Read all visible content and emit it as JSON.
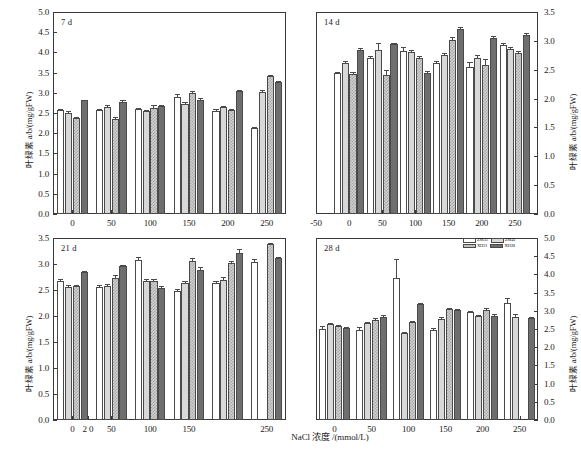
{
  "figure": {
    "xlabel": "NaCl 浓度 /(mmol/L)",
    "ylabel": "叶绿素 a/b/(mg/gFW)",
    "legend": [
      {
        "key": "ZM35",
        "label": "ZM35",
        "style": "open-white"
      },
      {
        "key": "ZM41",
        "label": "ZM41",
        "style": "light-gray"
      },
      {
        "key": "XH21",
        "label": "XH21",
        "style": "checkered"
      },
      {
        "key": "XH28",
        "label": "XH28",
        "style": "dark-gray"
      }
    ],
    "colors": {
      "ZM35": "#ffffff",
      "ZM41": "#d8d8d8",
      "XH21": "#cfcfcf",
      "XH28": "#6e6e6e",
      "axis": "#3a3a3a"
    }
  },
  "chart_data": [
    {
      "type": "bar",
      "title": "7 d",
      "panel": "top-left",
      "xlabel": "",
      "ylabel": "叶绿素 a/b/(mg/gFW)",
      "categories": [
        "0",
        "50",
        "100",
        "150",
        "200",
        "250"
      ],
      "xticks": [
        "0",
        "50",
        "100",
        "150",
        "200",
        "250"
      ],
      "xlim": [
        -25,
        275
      ],
      "ylim": [
        0.0,
        5.0
      ],
      "yticks": [
        "0.0",
        "0.5",
        "1.0",
        "1.5",
        "2.0",
        "2.5",
        "3.0",
        "3.5",
        "4.0",
        "4.5",
        "5.0"
      ],
      "yaxis_side": "left",
      "grid": false,
      "series": [
        {
          "name": "ZM35",
          "values": [
            2.57,
            2.58,
            2.59,
            2.89,
            2.55,
            2.13
          ],
          "errors": [
            0.03,
            0.02,
            0.03,
            0.07,
            0.04,
            0.02
          ]
        },
        {
          "name": "ZM41",
          "values": [
            2.51,
            2.65,
            2.54,
            2.73,
            2.64,
            3.02
          ],
          "errors": [
            0.04,
            0.05,
            0.03,
            0.03,
            0.03,
            0.05
          ]
        },
        {
          "name": "XH21",
          "values": [
            2.37,
            2.36,
            2.62,
            2.99,
            2.58,
            3.42
          ],
          "errors": [
            0.03,
            0.04,
            0.08,
            0.06,
            0.03,
            0.03
          ]
        },
        {
          "name": "XH28",
          "values": [
            2.81,
            2.78,
            2.68,
            2.83,
            3.04,
            3.26
          ],
          "errors": [
            0.02,
            0.03,
            0.03,
            0.03,
            0.03,
            0.03
          ]
        }
      ]
    },
    {
      "type": "bar",
      "title": "14 d",
      "panel": "top-right",
      "xlabel": "",
      "ylabel": "叶绿素 a/b/(mg/gFW)",
      "categories": [
        "0",
        "50",
        "100",
        "150",
        "200",
        "250"
      ],
      "xticks": [
        "-50",
        "0",
        "50",
        "100",
        "150",
        "200",
        "250"
      ],
      "xlim": [
        -50,
        285
      ],
      "ylim": [
        0.0,
        3.5
      ],
      "yticks": [
        "0.0",
        "0.5",
        "1.0",
        "1.5",
        "2.0",
        "2.5",
        "3.0",
        "3.5"
      ],
      "yaxis_side": "right",
      "grid": false,
      "series": [
        {
          "name": "ZM35",
          "values": [
            2.44,
            2.7,
            2.83,
            2.61,
            2.54,
            2.92
          ],
          "errors": [
            0.02,
            0.03,
            0.07,
            0.04,
            0.1,
            0.04
          ]
        },
        {
          "name": "ZM41",
          "values": [
            2.61,
            2.85,
            2.8,
            2.75,
            2.7,
            2.86
          ],
          "errors": [
            0.04,
            0.12,
            0.05,
            0.04,
            0.05,
            0.03
          ]
        },
        {
          "name": "XH21",
          "values": [
            2.43,
            2.4,
            2.7,
            3.02,
            2.58,
            2.79
          ],
          "errors": [
            0.03,
            0.09,
            0.04,
            0.05,
            0.1,
            0.04
          ]
        },
        {
          "name": "XH28",
          "values": [
            2.84,
            2.94,
            2.45,
            3.2,
            3.05,
            3.1
          ],
          "errors": [
            0.03,
            0.03,
            0.03,
            0.04,
            0.03,
            0.03
          ]
        }
      ]
    },
    {
      "type": "bar",
      "title": "21 d",
      "panel": "bottom-left",
      "xlabel": "NaCl 浓度 /(mmol/L)",
      "ylabel": "叶绿素 a/b/(mg/gFW)",
      "categories": [
        "0",
        "50",
        "100",
        "150",
        "200",
        "250"
      ],
      "xticks": [
        "0",
        "50",
        "100",
        "150",
        "2 0",
        "250"
      ],
      "xlim": [
        -25,
        275
      ],
      "ylim": [
        0.0,
        3.5
      ],
      "yticks": [
        "0.0",
        "0.5",
        "1.0",
        "1.5",
        "2.0",
        "2.5",
        "3.0",
        "3.5"
      ],
      "yaxis_side": "left",
      "grid": false,
      "series": [
        {
          "name": "ZM35",
          "values": [
            2.68,
            2.56,
            3.08,
            2.49,
            2.64,
            3.04
          ],
          "errors": [
            0.03,
            0.03,
            0.05,
            0.02,
            0.03,
            0.05
          ]
        },
        {
          "name": "ZM41",
          "values": [
            2.56,
            2.58,
            2.67,
            2.63,
            2.7,
            null
          ],
          "errors": [
            0.04,
            0.03,
            0.04,
            0.04,
            0.05,
            null
          ]
        },
        {
          "name": "XH21",
          "values": [
            2.57,
            2.73,
            2.68,
            3.06,
            3.02,
            3.38
          ],
          "errors": [
            0.03,
            0.05,
            0.04,
            0.05,
            0.04,
            0.02
          ]
        },
        {
          "name": "XH28",
          "values": [
            2.84,
            2.97,
            2.54,
            2.88,
            3.22,
            3.12
          ],
          "errors": [
            0.03,
            0.02,
            0.03,
            0.06,
            0.06,
            0.02
          ]
        }
      ]
    },
    {
      "type": "bar",
      "title": "28 d",
      "panel": "bottom-right",
      "xlabel": "",
      "ylabel": "叶绿素 a/b/(mg/gFW)",
      "categories": [
        "0",
        "50",
        "100",
        "150",
        "200",
        "250"
      ],
      "xticks": [
        "0",
        "50",
        "100",
        "150",
        "200",
        "250"
      ],
      "xlim": [
        -25,
        275
      ],
      "ylim": [
        0.0,
        5.0
      ],
      "yticks": [
        "0.0",
        "0.5",
        "1.0",
        "1.5",
        "2.0",
        "2.5",
        "3.0",
        "3.5",
        "4.0",
        "4.5",
        "5.0"
      ],
      "yaxis_side": "right",
      "grid": false,
      "series": [
        {
          "name": "ZM35",
          "values": [
            2.5,
            2.48,
            3.9,
            2.47,
            2.97,
            3.22
          ],
          "errors": [
            0.07,
            0.08,
            0.52,
            0.06,
            0.03,
            0.12
          ]
        },
        {
          "name": "ZM41",
          "values": [
            2.63,
            2.66,
            2.38,
            2.78,
            2.85,
            2.82
          ],
          "errors": [
            0.03,
            0.03,
            0.04,
            0.04,
            0.03,
            0.08
          ]
        },
        {
          "name": "XH21",
          "values": [
            2.58,
            2.76,
            2.68,
            3.05,
            3.02,
            null
          ],
          "errors": [
            0.03,
            0.04,
            0.04,
            0.03,
            0.05,
            null
          ]
        },
        {
          "name": "XH28",
          "values": [
            2.53,
            2.84,
            3.19,
            3.02,
            2.87,
            2.8
          ],
          "errors": [
            0.03,
            0.04,
            0.03,
            0.03,
            0.03,
            0.03
          ]
        }
      ]
    }
  ]
}
